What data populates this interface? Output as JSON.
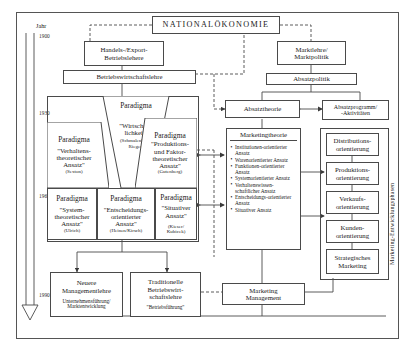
{
  "diagram": {
    "title": "NATIONALÖKONOMIE",
    "axis": {
      "caption": "Jahr",
      "years": [
        "1900",
        "1930",
        "1960",
        "1990"
      ]
    },
    "side_label": "Marketing-Entwicklungsphasen",
    "left_branch": {
      "handels": "Handels-/Export-\nBetriebslehere",
      "handels_l1": "Handels-/Export-",
      "handels_l2": "Betriebslehere",
      "bwl": "Betriebswirtschaftslehre",
      "paradigma_center_top": "Paradigma",
      "paradigma_center_title": "\"Wirtschaft-\nlichkeit\"",
      "paradigma_center_l1": "\"Wirtschaft-",
      "paradigma_center_l2": "lichkeit\"",
      "paradigma_center_src": "(Schmalenbach,\nRieger)",
      "paradigma_center_src1": "(Schmalenbach,",
      "paradigma_center_src2": "Rieger)",
      "paradigma_left_top": "Paradigma",
      "paradigma_left_l1": "\"Verhaltens-",
      "paradigma_left_l2": "theoretischer",
      "paradigma_left_l3": "Ansatz\"",
      "paradigma_left_src": "(Sexton)",
      "paradigma_right_top": "Paradigma",
      "paradigma_right_l1": "\"Produktions-",
      "paradigma_right_l2": "und Faktor-",
      "paradigma_right_l3": "theoretischer",
      "paradigma_right_l4": "Ansatz\"",
      "paradigma_right_src": "(Gutenberg)",
      "row3": [
        {
          "head": "Paradigma",
          "l1": "\"System-",
          "l2": "theoretischer",
          "l3": "Ansatz\"",
          "src": "(Ulrich)"
        },
        {
          "head": "Paradigma",
          "l1": "\"Entscheidungs-",
          "l2": "orientierter",
          "l3": "Ansatz\"",
          "src": "(Heinen/Kirsch)"
        },
        {
          "head": "Paradigma",
          "l1": "\"Situativer",
          "l2": "Ansatz\"",
          "l3": "",
          "src": "(Kieser/\nKubicek)",
          "src1": "(Kieser/",
          "src2": "Kubicek)"
        }
      ],
      "bottom_left_l1": "Neuere",
      "bottom_left_l2": "Managementlehre",
      "bottom_left_s1": "Unternehmensführung/",
      "bottom_left_s2": "Marktentwicklung",
      "bottom_right_l1": "Traditionelle",
      "bottom_right_l2": "Betriebswirt-",
      "bottom_right_l3": "schaftslehre",
      "bottom_right_s1": "\"Betriebsführung\""
    },
    "right_branch": {
      "marktlehre_l1": "Marktlehre/",
      "marktlehre_l2": "Marktpolitik",
      "absatzpolitik": "Absatzpolitik",
      "absatztheorie": "Absatztheorie",
      "absatzprogramm_l1": "Absatzprogramm/",
      "absatzprogramm_l2": "-Aktivitäten",
      "marketingtheorie": "Marketingtheorie",
      "marketingtheorie_items": [
        "Institutionen-orientierter Ansatz",
        "Warenorientierter Ansatz",
        "Funktionen-orientierter Ansatz",
        "Systemorientierter Ansatz",
        "Verhaltenswissen-schaftlicher Ansatz",
        "Entscheidungs-orientierter Ansatz",
        "Situativer Ansatz"
      ],
      "phases": [
        "Distributions-\norientierung",
        "Produktions-\norientierung",
        "Verkaufs-\norientierung",
        "Kunden-\norientierung",
        "Strategisches\nMarketing"
      ],
      "phase_lines": [
        {
          "a": "Distributions-",
          "b": "orientierung"
        },
        {
          "a": "Produktions-",
          "b": "orientierung"
        },
        {
          "a": "Verkaufs-",
          "b": "orientierung"
        },
        {
          "a": "Kunden-",
          "b": "orientierung"
        },
        {
          "a": "Strategisches",
          "b": "Marketing"
        }
      ],
      "marketing_management_l1": "Marketing",
      "marketing_management_l2": "Management"
    },
    "colors": {
      "line": "#4a4a4a",
      "frame": "#555555",
      "text": "#1a1a1a",
      "background": "#ffffff"
    }
  }
}
